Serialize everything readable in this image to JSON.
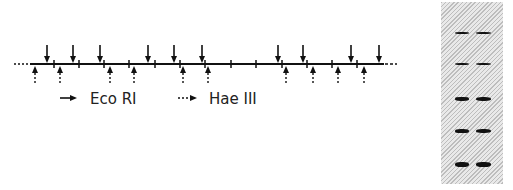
{
  "restriction_map": {
    "line_y": 64,
    "solid_line": {
      "x_start": 30,
      "x_end": 384
    },
    "dotted_left": {
      "x_start": 14,
      "x_end": 29
    },
    "dotted_right": {
      "x_start": 385,
      "x_end": 397
    },
    "tick_marks_x": [
      54,
      79,
      104,
      129,
      155,
      180,
      205,
      231,
      256,
      282,
      307,
      332,
      357
    ],
    "eco_ri_sites_x": [
      47,
      73,
      100,
      148,
      174,
      202,
      278,
      303,
      351,
      379
    ],
    "hae_iii_sites_x": [
      35,
      60,
      110,
      134,
      183,
      208,
      286,
      313,
      338,
      364
    ]
  },
  "legend": {
    "items": [
      {
        "icon": "solid-arrow-icon",
        "label": "Eco RI"
      },
      {
        "icon": "dotted-arrow-icon",
        "label": "Hae III"
      }
    ]
  },
  "gel": {
    "lanes": 2,
    "bands": [
      {
        "y": 33,
        "thickness": 2
      },
      {
        "y": 64,
        "thickness": 2.5
      },
      {
        "y": 99,
        "thickness": 3.5
      },
      {
        "y": 131,
        "thickness": 4
      },
      {
        "y": 164,
        "thickness": 5
      }
    ],
    "colors": {
      "band": "#111111",
      "background": "#d6d6d6"
    }
  }
}
